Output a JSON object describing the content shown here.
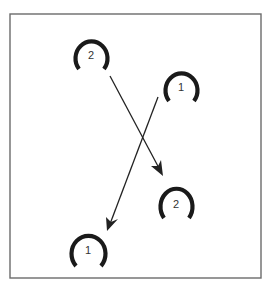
{
  "diagram": {
    "frame": {
      "x": 10,
      "y": 14,
      "width": 251,
      "height": 264,
      "stroke": "#6b6b6b"
    },
    "colors": {
      "shoe": "#1a1a1a",
      "arrow": "#222222",
      "label": "#333333"
    },
    "horseshoes": [
      {
        "id": "shoe-2-start",
        "label": "2",
        "cx": 91,
        "cy": 55
      },
      {
        "id": "shoe-1-start",
        "label": "1",
        "cx": 181,
        "cy": 87
      },
      {
        "id": "shoe-2-end",
        "label": "2",
        "cx": 176,
        "cy": 203
      },
      {
        "id": "shoe-1-end",
        "label": "1",
        "cx": 88,
        "cy": 249
      }
    ],
    "arrows": [
      {
        "id": "arrow-2",
        "from": [
          110,
          76
        ],
        "to": [
          162,
          174
        ],
        "label": "2 moves down-right"
      },
      {
        "id": "arrow-1",
        "from": [
          158,
          97
        ],
        "to": [
          108,
          230
        ],
        "label": "1 moves down-left"
      }
    ]
  }
}
